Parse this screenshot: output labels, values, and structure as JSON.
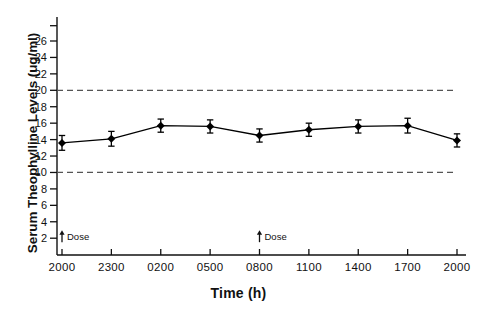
{
  "chart_data": {
    "type": "line",
    "title": "",
    "xlabel": "Time (h)",
    "ylabel": "Serum Theophylline Levels (ug/ml)",
    "x_categories": [
      "2000",
      "2300",
      "0200",
      "0500",
      "0800",
      "1100",
      "1400",
      "1700",
      "2000"
    ],
    "x_tick_labels": [
      "2000",
      "2300",
      "0200",
      "0500",
      "0800",
      "1100",
      "1400",
      "1700",
      "2000"
    ],
    "y_tick_labels": [
      "2",
      "4",
      "6",
      "8",
      "10",
      "12",
      "14",
      "16",
      "18",
      "20",
      "22",
      "24",
      "26"
    ],
    "y_tick_values": [
      2,
      4,
      6,
      8,
      10,
      12,
      14,
      16,
      18,
      20,
      22,
      24,
      26
    ],
    "ylim": [
      0,
      28
    ],
    "xlim": [
      0,
      8
    ],
    "grid": false,
    "legend": null,
    "series": [
      {
        "name": "Mean serum theophylline",
        "values": [
          13.6,
          14.1,
          15.7,
          15.6,
          14.5,
          15.2,
          15.6,
          15.7,
          13.9
        ],
        "errors": [
          0.9,
          0.9,
          0.8,
          0.8,
          0.8,
          0.8,
          0.8,
          0.9,
          0.8
        ],
        "marker": "filled-diamond",
        "color": "#000000"
      }
    ],
    "reference_lines": [
      {
        "name": "upper-therapeutic-limit",
        "value": 20,
        "style": "dashed",
        "color": "#555555"
      },
      {
        "name": "lower-therapeutic-limit",
        "value": 10,
        "style": "dashed",
        "color": "#555555"
      }
    ],
    "annotations": [
      {
        "name": "dose-annotation-2000",
        "label": "Dose",
        "x_category": "2000",
        "x_index": 0,
        "y": 2.0,
        "marker": "up-arrow"
      },
      {
        "name": "dose-annotation-0800",
        "label": "Dose",
        "x_category": "0800",
        "x_index": 4,
        "y": 2.0,
        "marker": "up-arrow"
      }
    ]
  },
  "axis": {
    "y_title": "Serum Theophylline Levels (ug/ml)",
    "x_title": "Time (h)"
  },
  "labels": {
    "dose": "Dose"
  }
}
